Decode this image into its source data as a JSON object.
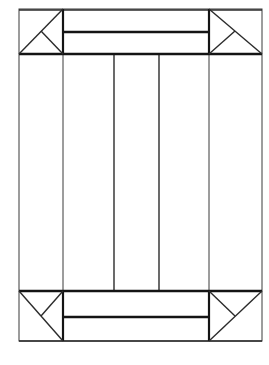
{
  "drawing": {
    "title": "Frame Joinery Line Drawing",
    "type": "technical-line-drawing",
    "canvas": {
      "width": 269,
      "height": 365,
      "background": "#ffffff"
    },
    "stroke_colors": {
      "thin": "#3a3a3a",
      "medium": "#2b2b2b",
      "heavy": "#141414"
    },
    "outer_frame": {
      "label": "outer-frame-rectangle",
      "x1": 19,
      "y1": 9,
      "x2": 262,
      "y2": 341,
      "width": 243,
      "height": 332
    },
    "rails_and_stiles": {
      "left_stile_inner_x": 63,
      "right_stile_inner_x": 209,
      "top_rail_inner_y": 54,
      "bottom_rail_inner_y": 291,
      "stile_width": 44,
      "rail_height": 45
    },
    "vertical_lines": [
      {
        "label": "left-stile-inner-edge",
        "x": 63,
        "y1": 9,
        "y2": 341,
        "weight": "thin"
      },
      {
        "label": "panel-divider-1",
        "x": 114,
        "y1": 54,
        "y2": 291,
        "weight": "medium"
      },
      {
        "label": "panel-divider-2",
        "x": 159,
        "y1": 54,
        "y2": 291,
        "weight": "medium"
      },
      {
        "label": "right-stile-inner-edge",
        "x": 209,
        "y1": 9,
        "y2": 341,
        "weight": "thin"
      }
    ],
    "horizontal_lines": [
      {
        "label": "outer-top-edge",
        "y": 10,
        "x1": 19,
        "x2": 262,
        "weight": "medium"
      },
      {
        "label": "top-bar-divider",
        "y": 32,
        "x1": 63,
        "x2": 209,
        "weight": "heavy"
      },
      {
        "label": "top-rail-inner-edge",
        "y": 54,
        "x1": 19,
        "x2": 262,
        "weight": "heavy"
      },
      {
        "label": "bottom-rail-inner-edge",
        "y": 291,
        "x1": 19,
        "x2": 262,
        "weight": "heavy"
      },
      {
        "label": "bottom-bar-divider",
        "y": 317,
        "x1": 63,
        "x2": 209,
        "weight": "heavy"
      },
      {
        "label": "outer-bottom-edge",
        "y": 341,
        "x1": 19,
        "x2": 262,
        "weight": "medium"
      }
    ],
    "corner_joints": [
      {
        "label": "miter-joint-top-left",
        "position": "top-left",
        "box": {
          "x1": 19,
          "y1": 9,
          "x2": 63,
          "y2": 54
        },
        "diagonal": {
          "from": [
            19,
            54
          ],
          "to": [
            63,
            9
          ]
        },
        "tick": {
          "from": [
            41,
            31
          ],
          "to": [
            63,
            54
          ]
        }
      },
      {
        "label": "miter-joint-top-right",
        "position": "top-right",
        "box": {
          "x1": 209,
          "y1": 9,
          "x2": 262,
          "y2": 54
        },
        "diagonal": {
          "from": [
            209,
            9
          ],
          "to": [
            262,
            54
          ]
        },
        "tick": {
          "from": [
            235,
            31
          ],
          "to": [
            209,
            54
          ]
        }
      },
      {
        "label": "miter-joint-bottom-left",
        "position": "bottom-left",
        "box": {
          "x1": 19,
          "y1": 291,
          "x2": 63,
          "y2": 341
        },
        "diagonal": {
          "from": [
            19,
            291
          ],
          "to": [
            63,
            341
          ]
        },
        "tick": {
          "from": [
            41,
            316
          ],
          "to": [
            63,
            291
          ]
        }
      },
      {
        "label": "miter-joint-bottom-right",
        "position": "bottom-right",
        "box": {
          "x1": 209,
          "y1": 291,
          "x2": 262,
          "y2": 341
        },
        "diagonal": {
          "from": [
            209,
            341
          ],
          "to": [
            262,
            291
          ]
        },
        "tick": {
          "from": [
            235,
            316
          ],
          "to": [
            209,
            291
          ]
        }
      }
    ],
    "panels": [
      {
        "label": "panel-left",
        "x1": 63,
        "y1": 54,
        "x2": 114,
        "y2": 291
      },
      {
        "label": "panel-center",
        "x1": 114,
        "y1": 54,
        "x2": 159,
        "y2": 291
      },
      {
        "label": "panel-right",
        "x1": 159,
        "y1": 54,
        "x2": 209,
        "y2": 291
      }
    ],
    "bars": [
      {
        "label": "top-bar",
        "x1": 63,
        "y1": 32,
        "x2": 209,
        "y2": 54
      },
      {
        "label": "bottom-bar",
        "x1": 63,
        "y1": 291,
        "x2": 209,
        "y2": 317
      }
    ]
  }
}
